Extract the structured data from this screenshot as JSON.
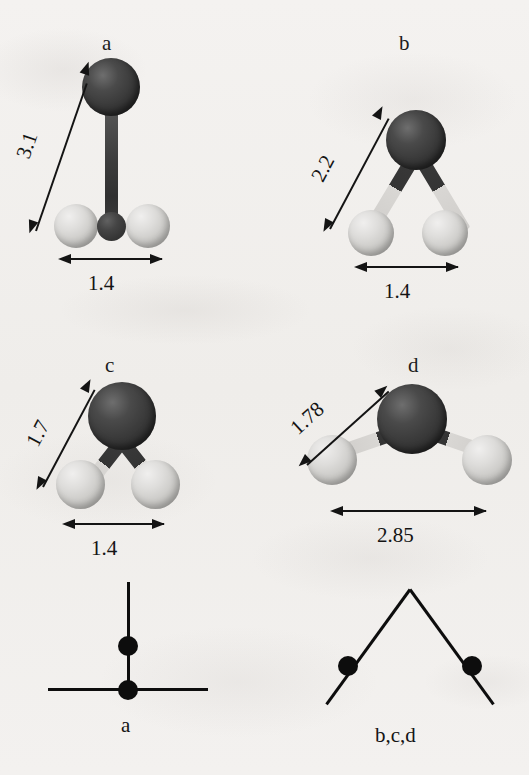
{
  "figure": {
    "background_color": "#f2f0ee",
    "ink_color": "#141414",
    "atom_dark_color": "#3a3a3a",
    "atom_light_color": "#d4d2cf"
  },
  "panels": [
    {
      "id": "a",
      "label": "a",
      "geometry": "linear-vertical-T",
      "vertical_dimension": "3.1",
      "horizontal_dimension": "1.4",
      "dark_atoms": 2,
      "light_atoms": 2
    },
    {
      "id": "b",
      "label": "b",
      "geometry": "bent-narrow",
      "vertical_dimension": "2.2",
      "horizontal_dimension": "1.4",
      "dark_atoms": 1,
      "light_atoms": 2
    },
    {
      "id": "c",
      "label": "c",
      "geometry": "bent-narrow-short",
      "vertical_dimension": "1.7",
      "horizontal_dimension": "1.4",
      "dark_atoms": 1,
      "light_atoms": 2
    },
    {
      "id": "d",
      "label": "d",
      "geometry": "bent-wide",
      "vertical_dimension": "1.78",
      "horizontal_dimension": "2.85",
      "dark_atoms": 1,
      "light_atoms": 2
    }
  ],
  "schematics": [
    {
      "id": "sch-a",
      "label": "a",
      "shape": "T-shape",
      "dots": 2
    },
    {
      "id": "sch-bcd",
      "label": "b,c,d",
      "shape": "inverted-V",
      "dots": 2
    }
  ]
}
